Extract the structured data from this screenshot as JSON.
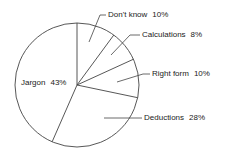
{
  "chart_data": {
    "type": "pie",
    "title": "",
    "categories": [
      "Don't know",
      "Calculations",
      "Right form",
      "Deductions",
      "Jargon"
    ],
    "values": [
      10,
      8,
      10,
      28,
      43
    ],
    "unit": "%",
    "start_angle_deg": 0,
    "direction": "clockwise",
    "labels": [
      {
        "name": "Don't know",
        "pct": "10%"
      },
      {
        "name": "Calculations",
        "pct": "8%"
      },
      {
        "name": "Right form",
        "pct": "10%"
      },
      {
        "name": "Deductions",
        "pct": "28%"
      },
      {
        "name": "Jargon",
        "pct": "43%"
      }
    ],
    "legend": "none (leader-line labels)",
    "colors": {
      "fill": "#ffffff",
      "stroke": "#444444",
      "text": "#222222"
    }
  }
}
